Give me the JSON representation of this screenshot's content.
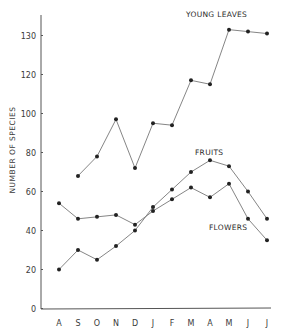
{
  "chart_data": {
    "type": "line",
    "title": "",
    "xlabel": "",
    "ylabel": "NUMBER OF SPECIES",
    "categories": [
      "A",
      "S",
      "O",
      "N",
      "D",
      "J",
      "F",
      "M",
      "A",
      "M",
      "J",
      "J"
    ],
    "y_ticks": [
      0,
      20,
      40,
      60,
      80,
      100,
      120,
      130
    ],
    "y_tick_positions": [
      0,
      20,
      40,
      60,
      80,
      100,
      120,
      140
    ],
    "ylim": [
      0,
      150
    ],
    "grid": false,
    "legend": "inline labels",
    "series": [
      {
        "name": "YOUNG LEAVES",
        "values": [
          null,
          68,
          78,
          97,
          72,
          95,
          94,
          117,
          115,
          143,
          142,
          141
        ]
      },
      {
        "name": "FRUITS",
        "values": [
          20,
          30,
          25,
          32,
          40,
          52,
          61,
          70,
          76,
          73,
          60,
          46
        ]
      },
      {
        "name": "FLOWERS",
        "values": [
          54,
          46,
          47,
          48,
          43,
          50,
          56,
          62,
          57,
          64,
          46,
          35
        ]
      }
    ]
  },
  "labels": {
    "young_leaves": "YOUNG LEAVES",
    "fruits": "FRUITS",
    "flowers": "FLOWERS",
    "y_axis_title": "NUMBER OF SPECIES"
  }
}
